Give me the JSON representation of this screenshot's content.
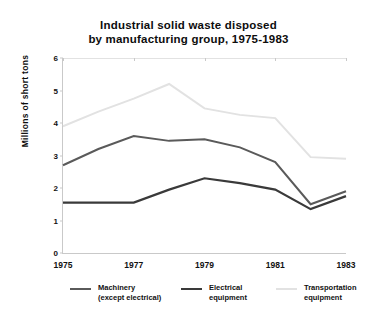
{
  "chart_data": {
    "type": "line",
    "title": "Industrial solid waste disposed by manufacturing group, 1975-1983",
    "title_line1": "Industrial solid waste disposed",
    "title_line2": "by manufacturing group, 1975-1983",
    "xlabel": "",
    "ylabel": "Millions of short tons",
    "ylim": [
      0,
      6
    ],
    "xlim": [
      1975,
      1983
    ],
    "grid": false,
    "legend_position": "bottom",
    "yticks": [
      "0",
      "1",
      "2",
      "3",
      "4",
      "5",
      "6"
    ],
    "ytick_values": [
      0,
      1,
      2,
      3,
      4,
      5,
      6
    ],
    "xticks": [
      "1975",
      "1977",
      "1979",
      "1981",
      "1983"
    ],
    "xtick_values": [
      1975,
      1977,
      1979,
      1981,
      1983
    ],
    "x": [
      1975,
      1976,
      1977,
      1978,
      1979,
      1980,
      1981,
      1982,
      1983
    ],
    "series": [
      {
        "name": "Machinery (except electrical)",
        "legend_line1": "Machinery",
        "legend_line2": "(except electrical)",
        "color": "#5a5a5a",
        "width": 2.0,
        "values": [
          2.7,
          3.2,
          3.6,
          3.45,
          3.5,
          3.25,
          2.8,
          1.5,
          1.9
        ]
      },
      {
        "name": "Electrical equipment",
        "legend_line1": "Electrical",
        "legend_line2": "equipment",
        "color": "#3a3a3a",
        "width": 2.2,
        "values": [
          1.55,
          1.55,
          1.55,
          1.95,
          2.3,
          2.15,
          1.95,
          1.35,
          1.75
        ]
      },
      {
        "name": "Transportation equipment",
        "legend_line1": "Transportation",
        "legend_line2": "equipment",
        "color": "#e2e2e2",
        "width": 2.0,
        "values": [
          3.9,
          4.35,
          4.75,
          5.2,
          4.45,
          4.25,
          4.15,
          2.95,
          2.9
        ]
      }
    ]
  }
}
